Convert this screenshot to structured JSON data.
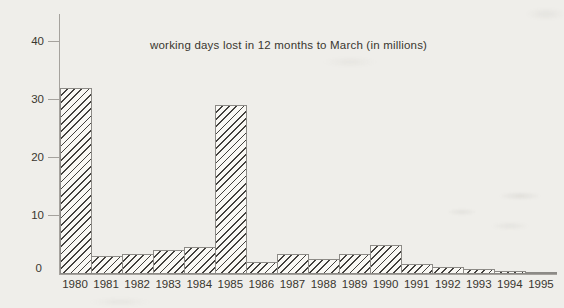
{
  "chart_data": {
    "type": "bar",
    "title": "working days lost in 12 months to March (in millions)",
    "categories": [
      "1980",
      "1981",
      "1982",
      "1983",
      "1984",
      "1985",
      "1986",
      "1987",
      "1988",
      "1989",
      "1990",
      "1991",
      "1992",
      "1993",
      "1994",
      "1995"
    ],
    "values": [
      32,
      3,
      3.4,
      4,
      4.5,
      29,
      2,
      3.3,
      2.5,
      3.3,
      5,
      1.6,
      1.2,
      0.8,
      0.5,
      0.25
    ],
    "xlabel": "",
    "ylabel": "",
    "ylim": [
      0,
      44
    ],
    "yticks": [
      0,
      10,
      20,
      30,
      40
    ],
    "grid": false,
    "legend": false,
    "bar_hatch": "forward-diagonal",
    "colors": {
      "paper": "#efeeea",
      "bar_fill": "#f9f8f4",
      "hatch_line": "#42403d",
      "bar_outline": "#8c8a86",
      "axis": "#a5a29d",
      "text": "#39362f"
    }
  }
}
